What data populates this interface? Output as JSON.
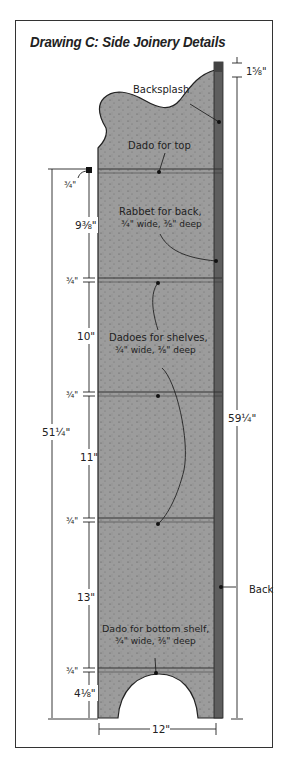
{
  "title": "Drawing C: Side Joinery Details",
  "callouts": {
    "backsplash": "Backsplash",
    "dado_top": "Dado for top",
    "rabbet_line1": "Rabbet for back,",
    "rabbet_line2": "¾\" wide, ⅜\" deep",
    "shelves_line1": "Dadoes for shelves,",
    "shelves_line2": "¾\" wide, ⅜\" deep",
    "bottom_line1": "Dado for bottom shelf,",
    "bottom_line2": "¾\" wide, ⅜\" deep",
    "back": "Back"
  },
  "dimensions": {
    "top_overhang": "1⅝\"",
    "total_height": "59¼\"",
    "inner_height": "51¼\"",
    "width": "12\"",
    "dado1": "¾\"",
    "space1": "9⅜\"",
    "dado2": "¾\"",
    "space2": "10\"",
    "dado3": "¾\"",
    "space3": "11\"",
    "dado4": "¾\"",
    "space4": "13\"",
    "dado5": "¾\"",
    "space5": "4⅛\""
  },
  "colors": {
    "board": "#9c9c9c",
    "back_edge": "#5a5a5a",
    "line": "#222222"
  }
}
